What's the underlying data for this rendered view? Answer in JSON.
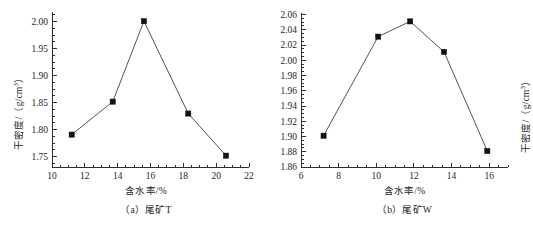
{
  "figure": {
    "background": "#ffffff",
    "line_color": "#404040",
    "marker_color": "#111111",
    "axis_color": "#303030"
  },
  "panels": [
    {
      "id": "a",
      "caption": "（a）尾矿T",
      "xlabel": "含水率/%",
      "ylabel_main": "干密度/（g/cm",
      "ylabel_sup": "3",
      "ylabel_tail": "）"
    },
    {
      "id": "b",
      "caption": "（b）尾矿W",
      "xlabel": "含水率/%",
      "ylabel_main": "干密度/（g/cm",
      "ylabel_sup": "3",
      "ylabel_tail": "）"
    }
  ],
  "chart_data": [
    {
      "type": "line",
      "panel": "a",
      "title": "（a）尾矿T",
      "xlabel": "含水率/%",
      "ylabel": "干密度/（g/cm3）",
      "x": [
        11.2,
        13.7,
        15.6,
        18.3,
        20.6
      ],
      "values": [
        1.791,
        1.852,
        2.001,
        1.83,
        1.752
      ],
      "xlim": [
        10,
        22
      ],
      "ylim": [
        1.731,
        2.018
      ],
      "xticks": [
        10,
        12,
        14,
        16,
        18,
        20,
        22
      ],
      "xticklabels": [
        "10",
        "12",
        "14",
        "16",
        "18",
        "20",
        "22"
      ],
      "yticks": [
        1.75,
        1.8,
        1.85,
        1.9,
        1.95,
        2.0
      ],
      "yticklabels": [
        "1.75",
        "1.80",
        "1.85",
        "1.90",
        "1.95",
        "2.00"
      ],
      "x_minor_step": 0.5,
      "y_minor_step": 0.0125,
      "grid": false,
      "legend": null,
      "marker": "square"
    },
    {
      "type": "line",
      "panel": "b",
      "title": "（b）尾矿W",
      "xlabel": "含水率/%",
      "ylabel": "干密度/（g/cm3）",
      "x": [
        7.2,
        10.1,
        11.8,
        13.6,
        15.9
      ],
      "values": [
        1.901,
        2.031,
        2.051,
        2.011,
        1.881
      ],
      "xlim": [
        6,
        17
      ],
      "ylim": [
        1.86,
        2.062
      ],
      "xticks": [
        6,
        8,
        10,
        12,
        14,
        16
      ],
      "xticklabels": [
        "6",
        "8",
        "10",
        "12",
        "14",
        "16"
      ],
      "yticks": [
        1.86,
        1.88,
        1.9,
        1.92,
        1.94,
        1.96,
        1.98,
        2.0,
        2.02,
        2.04,
        2.06
      ],
      "yticklabels": [
        "1.86",
        "1.88",
        "1.90",
        "1.92",
        "1.94",
        "1.96",
        "1.98",
        "2.00",
        "2.02",
        "2.04",
        "2.06"
      ],
      "x_minor_step": 0.5,
      "y_minor_step": 0.005,
      "grid": false,
      "legend": null,
      "marker": "square"
    }
  ]
}
